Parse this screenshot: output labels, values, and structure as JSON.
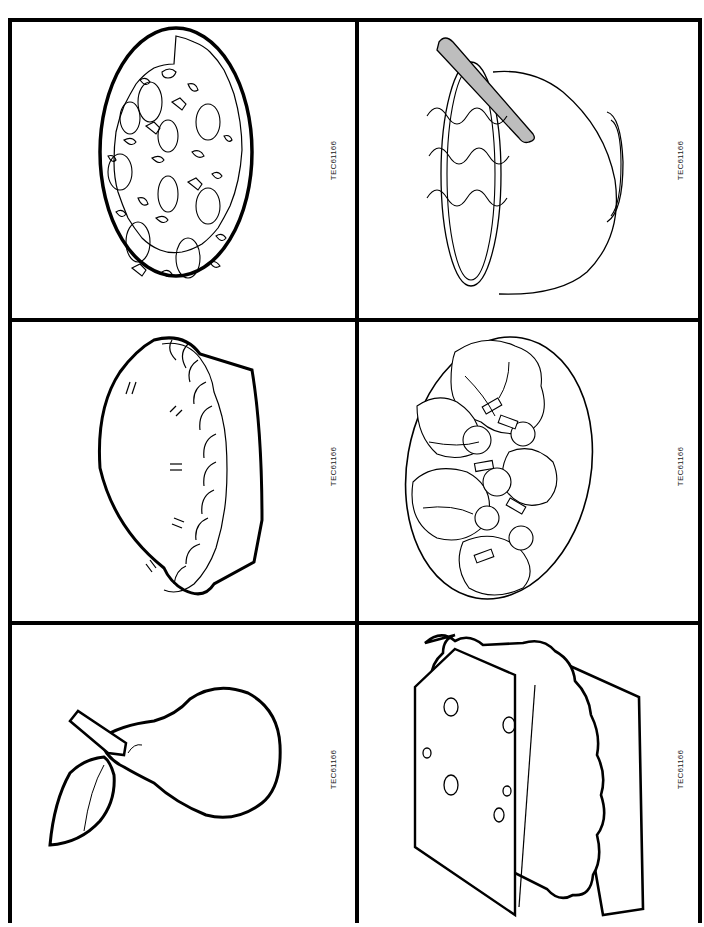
{
  "page": {
    "header_text": "",
    "border_color": "#000000",
    "background": "#ffffff"
  },
  "cards": [
    {
      "row": 1,
      "col": 1,
      "item": "pizza",
      "code": "TEC61166"
    },
    {
      "row": 1,
      "col": 2,
      "item": "soup-bowl",
      "code": "TEC61166"
    },
    {
      "row": 2,
      "col": 1,
      "item": "pie",
      "code": "TEC61166"
    },
    {
      "row": 2,
      "col": 2,
      "item": "salad",
      "code": "TEC61166"
    },
    {
      "row": 3,
      "col": 1,
      "item": "pear",
      "code": "TEC61166"
    },
    {
      "row": 3,
      "col": 2,
      "item": "sandwich",
      "code": "TEC61166"
    }
  ],
  "colors": {
    "line": "#000000",
    "spoon_fill": "#bdbdbd"
  }
}
